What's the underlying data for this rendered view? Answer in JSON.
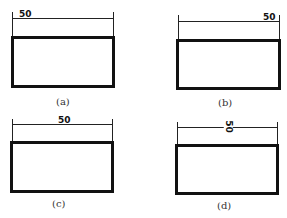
{
  "figures": [
    {
      "id": "a",
      "caption": "(a)",
      "dimension": "50",
      "text_position": "left",
      "text_rotation": 0
    },
    {
      "id": "b",
      "caption": "(b)",
      "dimension": "50",
      "text_position": "right",
      "text_rotation": 0
    },
    {
      "id": "c",
      "caption": "(c)",
      "dimension": "50",
      "text_position": "center",
      "text_rotation": 0
    },
    {
      "id": "d",
      "caption": "(d)",
      "dimension": "50",
      "text_position": "center",
      "text_rotation": 90
    }
  ],
  "colors": {
    "stroke": "#111111",
    "background": "#ffffff"
  }
}
